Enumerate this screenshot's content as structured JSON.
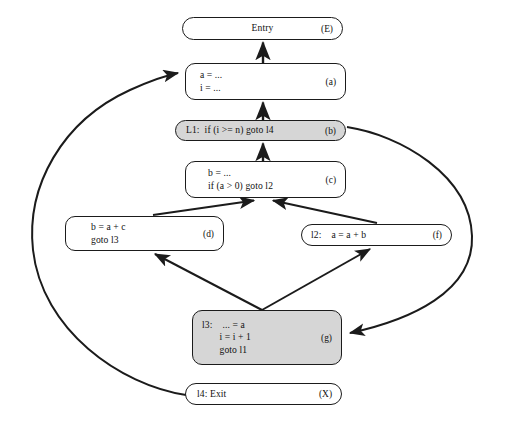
{
  "figure": {
    "type": "control-flow-graph",
    "background_color": "#ffffff",
    "edge_color": "#1b1b1b",
    "node_border_color": "#1b1b1b",
    "node_fill_color": "#ffffff",
    "shaded_fill_color": "#d6d6d6"
  },
  "nodes": [
    {
      "id": "E",
      "tag": "(E)",
      "lines": [
        "Entry"
      ],
      "shaded": false,
      "centered": true,
      "x": 182,
      "y": 17,
      "w": 161,
      "h": 23
    },
    {
      "id": "a",
      "tag": "(a)",
      "lines": [
        "a = ...",
        "i = ..."
      ],
      "shaded": false,
      "centered": false,
      "x": 185,
      "y": 63,
      "w": 161,
      "h": 37
    },
    {
      "id": "b",
      "tag": "(b)",
      "lines": [
        "L1:  if (i >= n) goto l4"
      ],
      "shaded": true,
      "centered": false,
      "x": 175,
      "y": 120,
      "w": 171,
      "h": 21
    },
    {
      "id": "c",
      "tag": "(c)",
      "lines": [
        "b = ...",
        "if (a > 0) goto l2"
      ],
      "shaded": false,
      "centered": false,
      "x": 185,
      "y": 161,
      "w": 161,
      "h": 37
    },
    {
      "id": "d",
      "tag": "(d)",
      "lines": [
        "b = a + c",
        "goto l3"
      ],
      "shaded": false,
      "centered": false,
      "x": 65,
      "y": 216,
      "w": 159,
      "h": 35
    },
    {
      "id": "f",
      "tag": "(f)",
      "lines": [
        "l2:    a = a + b"
      ],
      "shaded": false,
      "centered": false,
      "x": 301,
      "y": 224,
      "w": 151,
      "h": 22
    },
    {
      "id": "g",
      "tag": "(g)",
      "lines": [
        "l3:    ... = a",
        "       i = i + 1",
        "       goto l1"
      ],
      "shaded": true,
      "centered": false,
      "x": 192,
      "y": 310,
      "w": 150,
      "h": 55
    },
    {
      "id": "X",
      "tag": "(X)",
      "lines": [
        "l4: Exit"
      ],
      "shaded": false,
      "centered": false,
      "x": 185,
      "y": 383,
      "w": 157,
      "h": 22
    }
  ],
  "edges": [
    {
      "from": "a",
      "to": "E",
      "style": "straight",
      "arrow": "up"
    },
    {
      "from": "b",
      "to": "a",
      "style": "straight",
      "arrow": "up"
    },
    {
      "from": "c",
      "to": "b",
      "style": "straight",
      "arrow": "up"
    },
    {
      "from": "d",
      "to": "c",
      "style": "diagonal",
      "arrow": "up-right"
    },
    {
      "from": "f",
      "to": "c",
      "style": "diagonal",
      "arrow": "up-left"
    },
    {
      "from": "g",
      "to": "d",
      "style": "diagonal",
      "arrow": "up-left"
    },
    {
      "from": "g",
      "to": "f",
      "style": "diagonal",
      "arrow": "up-right"
    },
    {
      "from": "b",
      "to": "g",
      "style": "curve-right",
      "arrow": "down-left"
    },
    {
      "from": "X",
      "to": "a",
      "style": "curve-left",
      "arrow": "up-right"
    }
  ]
}
